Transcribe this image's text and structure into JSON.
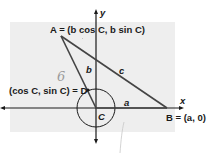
{
  "figure": {
    "panel_color": "#eeeeee",
    "line_color": "#1a1a1a",
    "pencil_color": "#9a9a9a",
    "axes": {
      "x_label": "x",
      "y_label": "y"
    },
    "points": {
      "A": {
        "name": "A",
        "label": "A = (b cos C, b sin C)"
      },
      "B": {
        "name": "B",
        "label": "B = (a, 0)"
      },
      "C": {
        "name": "C",
        "label": "C"
      },
      "D": {
        "name": "D",
        "label": "(cos C, sin C) = D"
      }
    },
    "sides": {
      "a": "a",
      "b": "b",
      "c": "c"
    },
    "handwritten_note": "6"
  }
}
